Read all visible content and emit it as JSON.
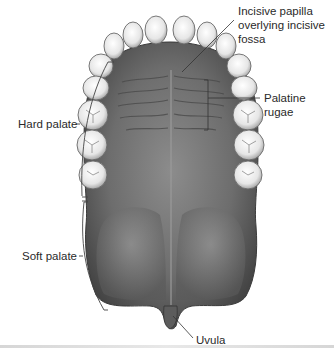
{
  "figure": {
    "labels": {
      "incisive_papilla": [
        "Incisive papilla",
        "overlying incisive",
        "fossa"
      ],
      "palatine_rugae": [
        "Palatine",
        "rugae"
      ],
      "hard_palate": "Hard palate",
      "soft_palate": "Soft palate",
      "uvula": "Uvula"
    },
    "colors": {
      "background": "#ffffff",
      "palate_tissue": "#6e6e6e",
      "teeth": "#efefef",
      "leader_lines": "#333333",
      "text": "#2a2a2a"
    }
  }
}
